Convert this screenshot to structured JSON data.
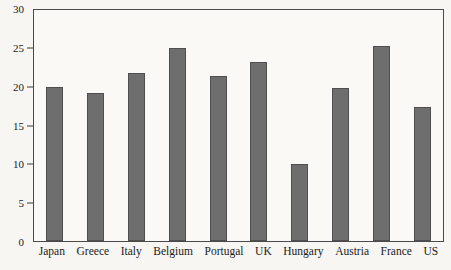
{
  "chart_data": {
    "type": "bar",
    "title": "",
    "subtitle": "",
    "xlabel": "",
    "ylabel": "",
    "categories": [
      "Japan",
      "Greece",
      "Italy",
      "Belgium",
      "Portugal",
      "UK",
      "Hungary",
      "Austria",
      "France",
      "US"
    ],
    "values": [
      19.8,
      19.1,
      21.6,
      24.9,
      21.3,
      23.0,
      9.9,
      19.7,
      25.1,
      17.3
    ],
    "ylim": [
      0,
      30
    ],
    "ytick_labels": [
      "0",
      "5",
      "10",
      "15",
      "20",
      "25",
      "30"
    ],
    "ytick_values": [
      0,
      5,
      10,
      15,
      20,
      25,
      30
    ],
    "grid": false,
    "legend": null,
    "legend_position": "none",
    "bar_color": "#6e6e6e",
    "bar_edge_color": "#4f4f4f",
    "frame_color": "#4a4a4a",
    "plot_background": "#faf9f6",
    "page_background": "#f7f6f3",
    "text_color": "#1a1a1a"
  },
  "background_bleed": {
    "title": "MONETARY POLICY",
    "line1": "ted the economy in the",
    "line2": "the economy during the easy",
    "line3": "argued that it is the fall in",
    "line4": "contraction was the crucial",
    "line5": "of monetary policy",
    "line6": "the long run the",
    "left_line1": "another from a country",
    "left_line2": "inflation and growth"
  }
}
